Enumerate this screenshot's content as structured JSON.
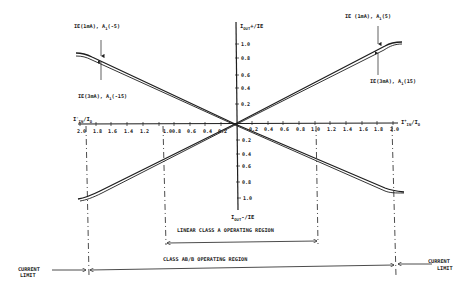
{
  "diagram": {
    "colors": {
      "ink": "#1e1e1e",
      "background": "#ffffff"
    },
    "axes": {
      "y_pos_label": {
        "main": "I",
        "sub": "OUT",
        "tail": "+/IE"
      },
      "y_neg_label": {
        "main": "I",
        "sub": "OUT",
        "tail": "-/IE"
      },
      "x_pos_label": {
        "main": "I",
        "sup": "+",
        "sub": "IN",
        "tail": "/I",
        "sub2": "O"
      },
      "x_neg_label": {
        "main": "I",
        "sup": "-",
        "sub": "IN",
        "tail": "/I",
        "sub2": "O"
      },
      "x_ticks_left": [
        "2.0",
        "1.8",
        "1.6",
        "1.4",
        "1.2",
        "1.0",
        "0.8",
        "0.6",
        "0.4",
        "0.2"
      ],
      "x_ticks_right": [
        "0.2",
        "0.4",
        "0.6",
        "0.8",
        "1.0",
        "1.2",
        "1.4",
        "1.6",
        "1.8",
        "2.0"
      ],
      "y_ticks_up": [
        "0.2",
        "0.4",
        "0.6",
        "0.8",
        "1.0"
      ],
      "y_ticks_down": [
        "0.2",
        "0.4",
        "0.6",
        "0.8",
        "1.0"
      ]
    },
    "annotations": {
      "top_left_upper": "IE(1mA), A",
      "top_left_upper_sub": "1",
      "top_left_upper_tail": "(-5)",
      "top_left_lower": "IE(3mA), A",
      "top_left_lower_sub": "1",
      "top_left_lower_tail": "(-15)",
      "top_right_upper": "IE (1mA), A",
      "top_right_upper_sub": "1",
      "top_right_upper_tail": "(5)",
      "top_right_lower": "IE(3mA), A",
      "top_right_lower_sub": "1",
      "top_right_lower_tail": "(15)"
    },
    "regions": {
      "linear_class_a": "LINEAR CLASS A OPERATING REGION",
      "class_ab_b": "CLASS AB/B OPERATING REGION",
      "current_limit_left_line1": "CURRENT",
      "current_limit_left_line2": "LIMIT",
      "current_limit_right_line1": "CURRENT",
      "current_limit_right_line2": "LIMIT"
    }
  }
}
